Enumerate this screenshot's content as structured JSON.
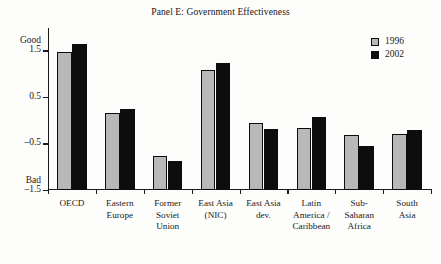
{
  "chart_data": {
    "type": "bar",
    "title": "Panel E: Government Effectiveness",
    "xlabel": "",
    "ylabel": "",
    "ylim": [
      -1.5,
      1.98
    ],
    "yticks": [
      1.5,
      0.5,
      -0.5,
      -1.5
    ],
    "ytick_labels": [
      "1.5",
      "0.5",
      "–0.5",
      "–1.5"
    ],
    "axis_high_label": "Good",
    "axis_low_label": "Bad",
    "grid": false,
    "legend_position": "top-right",
    "categories": [
      "OECD",
      "Eastern\nEurope",
      "Former\nSoviet\nUnion",
      "East Asia\n(NIC)",
      "East Asia\ndev.",
      "Latin\nAmerica /\nCaribbean",
      "Sub-\nSaharan\nAfrica",
      "South\nAsia"
    ],
    "series": [
      {
        "name": "1996",
        "color": "#b8b8b8",
        "values": [
          1.47,
          0.15,
          -0.77,
          1.08,
          -0.06,
          -0.16,
          -0.32,
          -0.3
        ]
      },
      {
        "name": "2002",
        "color": "#0d0d0d",
        "values": [
          1.64,
          0.25,
          -0.88,
          1.22,
          -0.19,
          0.06,
          -0.55,
          -0.21
        ]
      }
    ]
  },
  "legend": {
    "entries": [
      {
        "label": "1996"
      },
      {
        "label": "2002"
      }
    ]
  }
}
